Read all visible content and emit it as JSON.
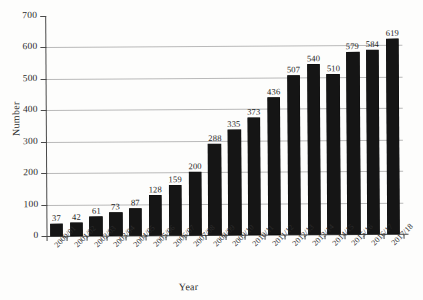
{
  "chart_data": {
    "type": "bar",
    "title": "",
    "xlabel": "Year",
    "ylabel": "Number",
    "ylim": [
      0,
      700
    ],
    "ytick_step": 100,
    "yticks": [
      0,
      100,
      200,
      300,
      400,
      500,
      600,
      700
    ],
    "grid": true,
    "gridlines_at": [
      100,
      200,
      300,
      400,
      500,
      600,
      700
    ],
    "legend": "none",
    "bar_color": "#151515",
    "grid_color": "#b9b9b9",
    "axis_color": "#4a4a4a",
    "categories": [
      "2000/01",
      "2001/02",
      "2002/03",
      "2003/04",
      "2004/05",
      "2005/06",
      "2006/07",
      "2007/08",
      "2008/09",
      "2009/10",
      "2010/11",
      "2011/12",
      "2012/13",
      "2013/14",
      "2014/15",
      "2015/16",
      "2016/17",
      "2017/18"
    ],
    "values": [
      37,
      42,
      61,
      73,
      87,
      128,
      159,
      200,
      288,
      335,
      373,
      436,
      507,
      540,
      510,
      579,
      584,
      619
    ],
    "data_labels": [
      "37",
      "42",
      "61",
      "73",
      "87",
      "128",
      "159",
      "200",
      "288",
      "335",
      "373",
      "436",
      "507",
      "540",
      "510",
      "579",
      "584",
      "619"
    ]
  }
}
